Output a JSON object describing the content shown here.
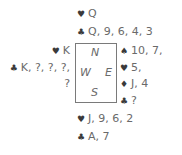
{
  "north": {
    "hearts": {
      "icon": "heart-icon",
      "glyph": "♥",
      "cards": "Q"
    },
    "clubs": {
      "icon": "club-icon",
      "glyph": "♣",
      "cards": "Q, 9, 6, 4, 3"
    }
  },
  "west": {
    "hearts": {
      "icon": "heart-icon",
      "glyph": "♥",
      "cards": "K"
    },
    "clubs": {
      "icon": "club-icon",
      "glyph": "♣",
      "cards": "K, ?, ?, ?,"
    },
    "clubs_cont": "?"
  },
  "east": {
    "spades": {
      "icon": "spade-icon",
      "glyph": "♠",
      "cards": "10, 7,"
    },
    "hearts": {
      "icon": "heart-icon",
      "glyph": "♥",
      "cards": "5,"
    },
    "diamonds": {
      "icon": "diamond-icon",
      "glyph": "♦",
      "cards": "J, 4"
    },
    "clubs": {
      "icon": "club-icon",
      "glyph": "♣",
      "cards": "?"
    }
  },
  "south": {
    "hearts": {
      "icon": "heart-icon",
      "glyph": "♥",
      "cards": "J, 9, 6, 2"
    },
    "clubs": {
      "icon": "club-icon",
      "glyph": "♣",
      "cards": "A, 7"
    }
  },
  "compass": {
    "n": "N",
    "w": "W",
    "e": "E",
    "s": "S"
  }
}
